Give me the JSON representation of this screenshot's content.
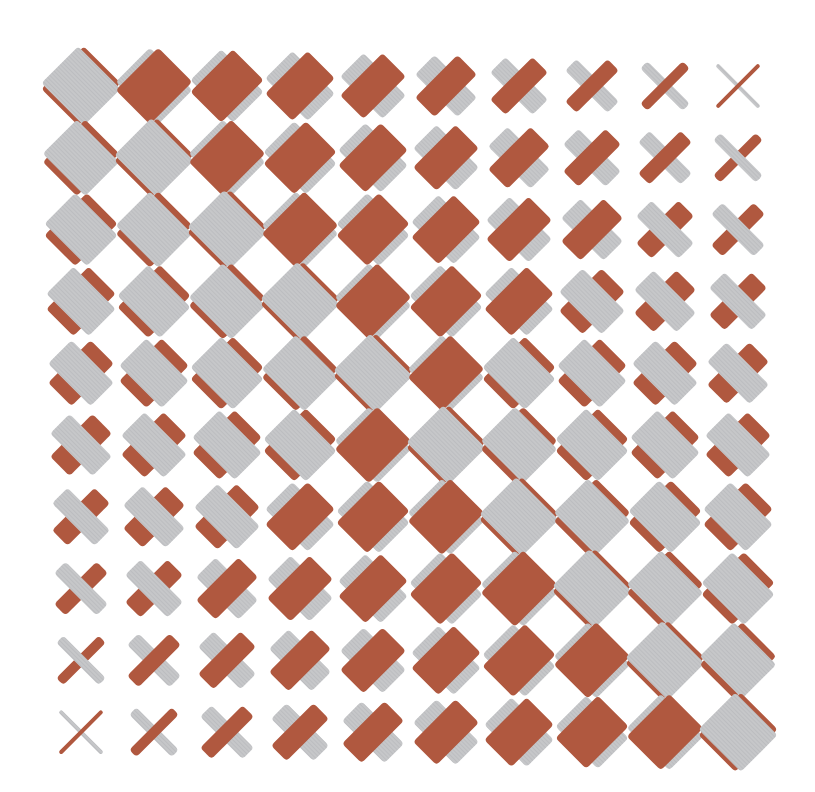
{
  "artwork": {
    "title": "Woven diagonal bars pattern",
    "rows": 10,
    "cols": 10,
    "origin": {
      "x": 81,
      "y": 86
    },
    "step": {
      "x": 73.0,
      "y": 71.8
    },
    "bar_length": 60,
    "min_width": 4,
    "max_width": 52,
    "colors": {
      "background": "#ffffff",
      "gray": "#c6c7c9",
      "gray_stripe": "#b4b5b8",
      "rust": "#b0583f"
    },
    "orientation": {
      "gray": "nw-se",
      "rust": "sw-ne"
    },
    "top_rule": "rows 0-4: rust on top when r < c <= 9-r (row 1 col 9 gray); rows 5-9: rust on top when 9-r <= c <= r-1; otherwise gray on top"
  }
}
